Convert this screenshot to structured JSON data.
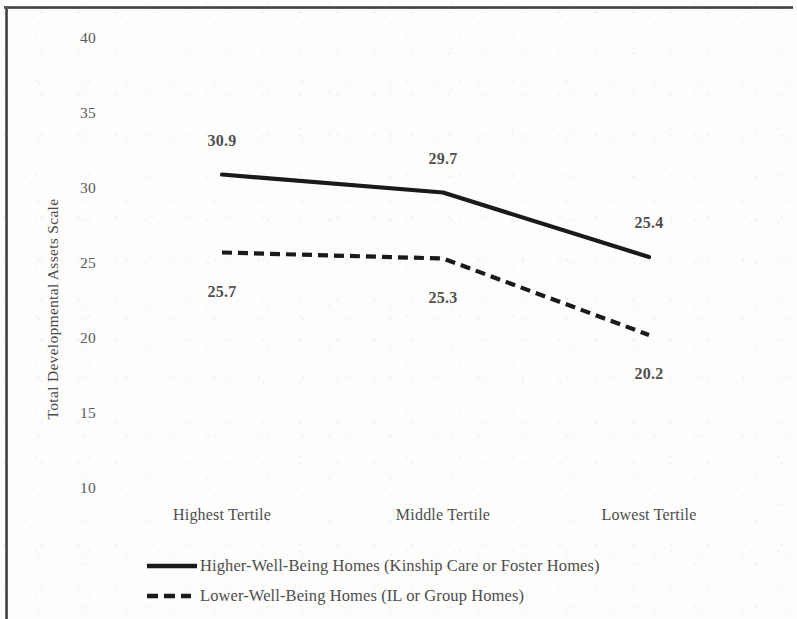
{
  "chart_data": {
    "type": "line",
    "title": "",
    "xlabel": "",
    "ylabel": "Total Developmental Assets Scale",
    "categories": [
      "Highest Tertile",
      "Middle Tertile",
      "Lowest Tertile"
    ],
    "ylim": [
      10,
      40
    ],
    "yticks": [
      10,
      15,
      20,
      25,
      30,
      35,
      40
    ],
    "ytick_labels": [
      "10",
      "15",
      "20",
      "25",
      "30",
      "35",
      "40"
    ],
    "grid": false,
    "legend_position": "bottom-left",
    "series": [
      {
        "name": "Higher-Well-Being Homes (Kinship Care or Foster Homes)",
        "style": "solid",
        "color": "#1a1a1a",
        "values": [
          30.9,
          29.7,
          25.4
        ],
        "labels": [
          "30.9",
          "29.7",
          "25.4"
        ],
        "label_position": "above"
      },
      {
        "name": "Lower-Well-Being Homes (IL or Group Homes)",
        "style": "dashed",
        "color": "#1a1a1a",
        "values": [
          25.7,
          25.3,
          20.2
        ],
        "labels": [
          "25.7",
          "25.3",
          "20.2"
        ],
        "label_position": "below"
      }
    ]
  },
  "legend": {
    "items": [
      {
        "label": "Higher-Well-Being Homes (Kinship Care or Foster Homes)",
        "swatch": "solid-line-swatch"
      },
      {
        "label": "Lower-Well-Being Homes (IL or Group Homes)",
        "swatch": "dashed-line-swatch"
      }
    ]
  }
}
